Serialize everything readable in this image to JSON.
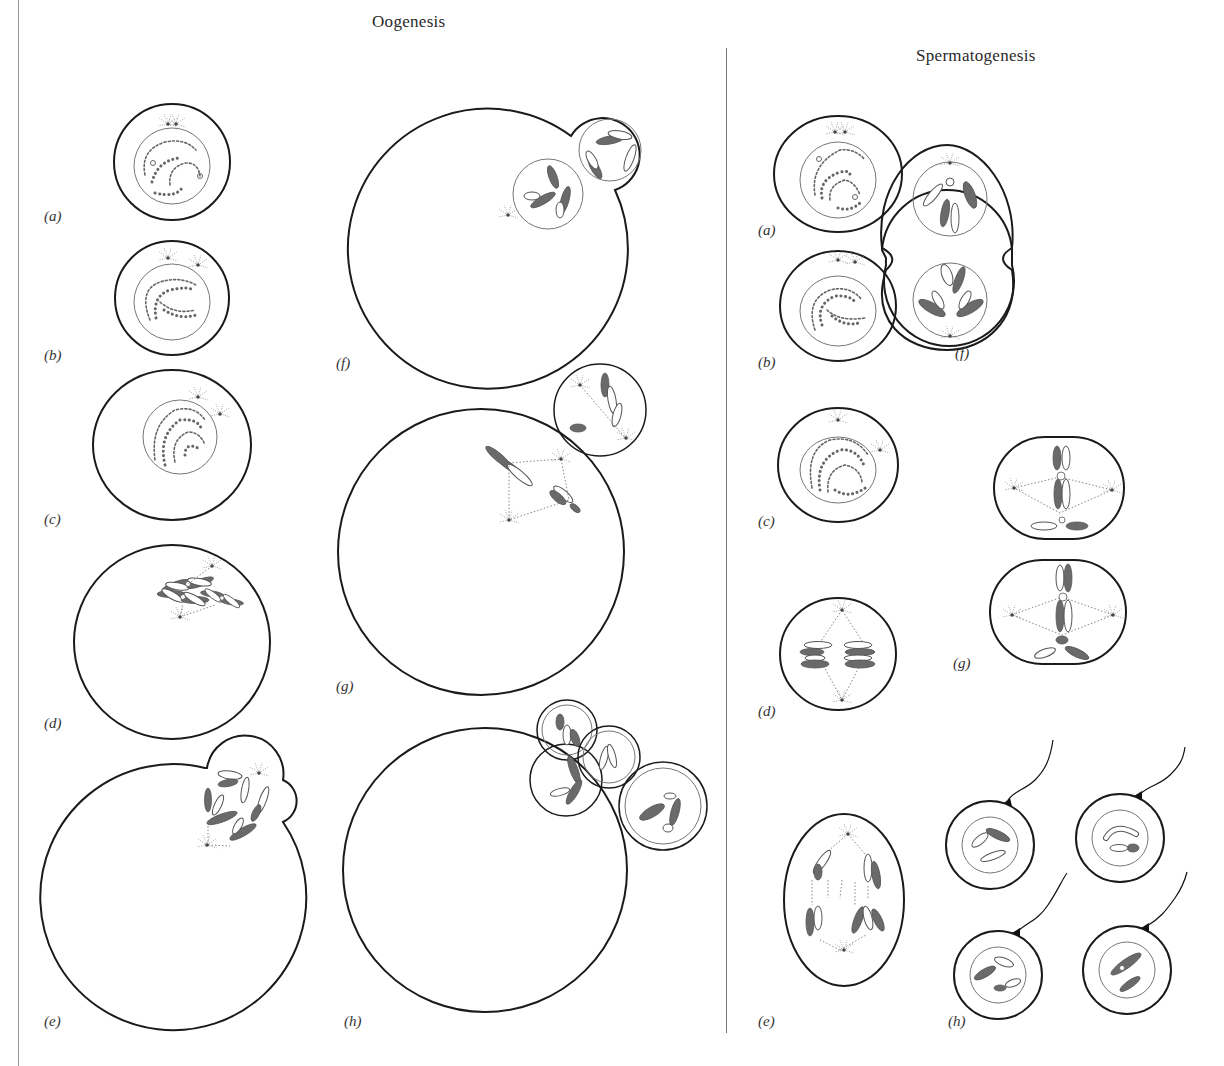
{
  "figure": {
    "columns": [
      {
        "id": "oogenesis",
        "title": "Oogenesis",
        "panels": [
          {
            "label": "(a)"
          },
          {
            "label": "(b)"
          },
          {
            "label": "(c)"
          },
          {
            "label": "(d)"
          },
          {
            "label": "(e)"
          },
          {
            "label": "(f)"
          },
          {
            "label": "(g)"
          },
          {
            "label": "(h)"
          }
        ]
      },
      {
        "id": "spermatogenesis",
        "title": "Spermatogenesis",
        "panels": [
          {
            "label": "(a)"
          },
          {
            "label": "(b)"
          },
          {
            "label": "(c)"
          },
          {
            "label": "(d)"
          },
          {
            "label": "(e)"
          },
          {
            "label": "(f)"
          },
          {
            "label": "(g)"
          },
          {
            "label": "(h)"
          }
        ]
      }
    ],
    "colors": {
      "outline": "#1a1a1a",
      "nucleus": "#777777",
      "chromosome_dark": "#6a6a6a",
      "chromosome_light": "#ffffff",
      "divider": "#777777"
    }
  }
}
